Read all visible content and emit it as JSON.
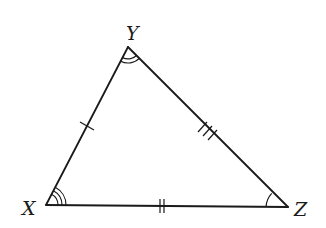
{
  "figure": {
    "type": "triangle",
    "stroke_color": "#1a1a1a",
    "background": "#ffffff"
  },
  "vertices": {
    "X": {
      "label": "X",
      "angle_marks": 3
    },
    "Y": {
      "label": "Y",
      "angle_marks": 2
    },
    "Z": {
      "label": "Z",
      "angle_marks": 1
    }
  },
  "sides": {
    "XY": {
      "tick_marks": 1
    },
    "YZ": {
      "tick_marks": 3
    },
    "XZ": {
      "tick_marks": 2
    }
  }
}
